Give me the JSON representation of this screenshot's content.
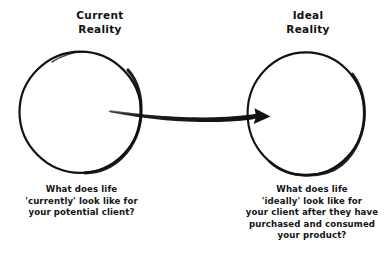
{
  "diagram": {
    "background_color": "#ffffff",
    "ink_color": "#111111",
    "nodes": [
      {
        "id": "current-reality",
        "heading": "Current\nReality",
        "shape": "circle",
        "caption": "What does life\n'currently' look like for\nyour potential client?"
      },
      {
        "id": "ideal-reality",
        "heading": "Ideal\nReality",
        "shape": "circle",
        "caption": "What does life\n'ideally' look like for\nyour client after they have\npurchased and consumed\nyour product?"
      }
    ],
    "connector": {
      "id": "transformation-arrow",
      "type": "curved-arrow",
      "from": "current-reality",
      "to": "ideal-reality",
      "direction": "left-to-right",
      "icon": "arrow-right-icon"
    }
  }
}
